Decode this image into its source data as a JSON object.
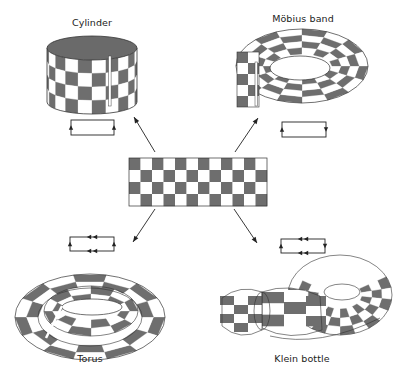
{
  "figure": {
    "colors": {
      "dark": "#6e6e6e",
      "light": "#ffffff",
      "stroke": "#333333",
      "top": "#6a6a6a"
    }
  },
  "center_sheet": {
    "columns": 12,
    "rows": 4,
    "first_cell": "dark",
    "x": 129,
    "y": 158,
    "width": 138,
    "height": 48
  },
  "surfaces": [
    {
      "id": "cylinder",
      "label": "Cylinder",
      "label_pos": [
        92,
        17
      ],
      "gluing_diagram": {
        "x": 71,
        "y": 120,
        "w": 43,
        "h": 15,
        "left": "up",
        "right": "up",
        "top": "none",
        "bottom": "none"
      }
    },
    {
      "id": "mobius",
      "label": "Möbius band",
      "label_pos": [
        303,
        13
      ],
      "gluing_diagram": {
        "x": 282,
        "y": 122,
        "w": 44,
        "h": 15,
        "left": "up",
        "right": "down",
        "top": "none",
        "bottom": "none"
      }
    },
    {
      "id": "torus",
      "label": "Torus",
      "label_pos": [
        90,
        352
      ],
      "gluing_diagram": {
        "x": 70,
        "y": 237,
        "w": 44,
        "h": 14,
        "left": "up",
        "right": "up",
        "top": "left-double",
        "bottom": "left-double"
      }
    },
    {
      "id": "klein",
      "label": "Klein bottle",
      "label_pos": [
        302,
        352
      ],
      "gluing_diagram": {
        "x": 281,
        "y": 239,
        "w": 44,
        "h": 14,
        "left": "up",
        "right": "down",
        "top": "left-double",
        "bottom": "left-double"
      }
    }
  ],
  "arrows": [
    {
      "to": "cylinder",
      "from": [
        155,
        152
      ],
      "tip": [
        134,
        117
      ]
    },
    {
      "to": "mobius",
      "from": [
        235,
        152
      ],
      "tip": [
        258,
        118
      ]
    },
    {
      "to": "torus",
      "from": [
        155,
        209
      ],
      "tip": [
        133,
        242
      ]
    },
    {
      "to": "klein",
      "from": [
        234,
        209
      ],
      "tip": [
        257,
        243
      ]
    }
  ]
}
